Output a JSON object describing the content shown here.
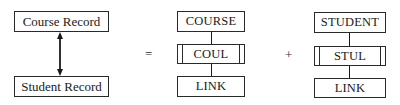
{
  "left": {
    "top_box": "Course Record",
    "bottom_box": "Student Record",
    "connector": "double-headed-arrow"
  },
  "operators": {
    "equals": "=",
    "plus": "+"
  },
  "middle": {
    "top_box": "COURSE",
    "mid_box": "COUL",
    "bottom_box": "LINK"
  },
  "right": {
    "top_box": "STUDENT",
    "mid_box": "STUL",
    "bottom_box": "LINK"
  },
  "colors": {
    "line": "#1a1a1a",
    "background": "#ffffff"
  }
}
